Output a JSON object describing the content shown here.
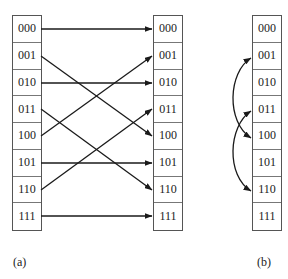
{
  "diagram": {
    "panel_a": {
      "label": "(a)",
      "description": "Perfect shuffle permutation",
      "source_cells": [
        "000",
        "001",
        "010",
        "011",
        "100",
        "101",
        "110",
        "111"
      ],
      "target_cells": [
        "000",
        "001",
        "010",
        "011",
        "100",
        "101",
        "110",
        "111"
      ],
      "mappings": [
        {
          "from": "000",
          "to": "000"
        },
        {
          "from": "001",
          "to": "010"
        },
        {
          "from": "010",
          "to": "100"
        },
        {
          "from": "011",
          "to": "110"
        },
        {
          "from": "100",
          "to": "001"
        },
        {
          "from": "101",
          "to": "011"
        },
        {
          "from": "110",
          "to": "101"
        },
        {
          "from": "111",
          "to": "111"
        }
      ]
    },
    "panel_b": {
      "label": "(b)",
      "description": "In-place swaps",
      "cells": [
        "000",
        "001",
        "010",
        "011",
        "100",
        "101",
        "110",
        "111"
      ],
      "swaps": [
        {
          "a": "001",
          "b": "100"
        },
        {
          "a": "011",
          "b": "110"
        }
      ]
    },
    "colors": {
      "line": "#1a1a1a",
      "box_border": "#555555",
      "text": "#222222",
      "background": "#ffffff"
    }
  }
}
